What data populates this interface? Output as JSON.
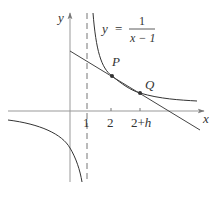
{
  "diagram": {
    "function_label": {
      "lhs": "y",
      "equals": "=",
      "numerator": "1",
      "denominator": "x − 1"
    },
    "axes": {
      "x_label": "x",
      "y_label": "y"
    },
    "ticks": {
      "t1": "1",
      "t2": "2",
      "t3": "2+h"
    },
    "points": {
      "P": "P",
      "Q": "Q"
    },
    "asymptote": "x = 1",
    "secant_line": "line through P and Q",
    "colors": {
      "axis": "#888888",
      "curve": "#333333",
      "line": "#444444",
      "point": "#333333",
      "text": "#333333"
    }
  }
}
